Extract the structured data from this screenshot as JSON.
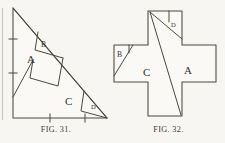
{
  "plate": {
    "title": "Geometric dissection plate",
    "background_color": "#f7f6f2",
    "ink_color": "#4a483f",
    "figure_count": 2
  },
  "figures": [
    {
      "id": "fig-31",
      "caption_main": "F",
      "caption_small": "IG",
      "caption_rest": ". 31.",
      "caption_text": "FIG. 31.",
      "shape": "right-triangle",
      "description": "Right triangle dissected into four pieces",
      "pieces": [
        {
          "key": "A",
          "label": "A",
          "label_x": 27,
          "label_y": 63
        },
        {
          "key": "B",
          "label": "B",
          "label_x": 41,
          "label_y": 44
        },
        {
          "key": "C",
          "label": "C",
          "label_x": 67,
          "label_y": 101
        },
        {
          "key": "D",
          "label": "D",
          "label_x": 94,
          "label_y": 105
        }
      ],
      "axis_ticks": {
        "vertical_count": 2,
        "horizontal_count": 2
      }
    },
    {
      "id": "fig-32",
      "caption_main": "F",
      "caption_small": "IG",
      "caption_rest": ". 32.",
      "caption_text": "FIG. 32.",
      "shape": "greek-cross",
      "description": "Greek cross reassembled from the same four pieces",
      "pieces": [
        {
          "key": "A",
          "label": "A",
          "label_x": 188,
          "label_y": 71
        },
        {
          "key": "B",
          "label": "B",
          "label_x": 122,
          "label_y": 52
        },
        {
          "key": "C",
          "label": "C",
          "label_x": 148,
          "label_y": 72
        },
        {
          "key": "D",
          "label": "D",
          "label_x": 175,
          "label_y": 24
        }
      ]
    }
  ],
  "caption_labels": {
    "fig31": "FIG. 31.",
    "fig32": "FIG. 32."
  }
}
